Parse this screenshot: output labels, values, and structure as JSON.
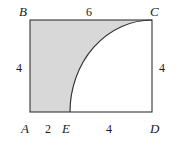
{
  "figure": {
    "kind": "geometry-diagram",
    "stroke_color": "#333333",
    "shade_color": "#d8d8d8",
    "background_color": "#ffffff",
    "vertices": [
      {
        "id": "B",
        "label": "B",
        "position": "top-left"
      },
      {
        "id": "C",
        "label": "C",
        "position": "top-right"
      },
      {
        "id": "A",
        "label": "A",
        "position": "bottom-left"
      },
      {
        "id": "D",
        "label": "D",
        "position": "bottom-right"
      },
      {
        "id": "E",
        "label": "E",
        "position": "bottom-edge-interior"
      }
    ],
    "lengths": [
      {
        "id": "top",
        "label": "6",
        "side": "BC",
        "value": 6
      },
      {
        "id": "left",
        "label": "4",
        "side": "AB",
        "value": 4
      },
      {
        "id": "right",
        "label": "4",
        "side": "CD",
        "value": 4
      },
      {
        "id": "bottom-left",
        "label": "2",
        "side": "AE",
        "value": 2
      },
      {
        "id": "bottom-right",
        "label": "4",
        "side": "ED",
        "value": 4
      }
    ],
    "geometry": {
      "rect": {
        "x": 30,
        "y": 20,
        "width": 122,
        "height": 92
      },
      "arc": {
        "start_x": 70,
        "start_y": 112,
        "end_x": 152,
        "end_y": 20,
        "rx": 82,
        "ry": 92,
        "sweep": 1,
        "large_arc": 0
      }
    }
  }
}
